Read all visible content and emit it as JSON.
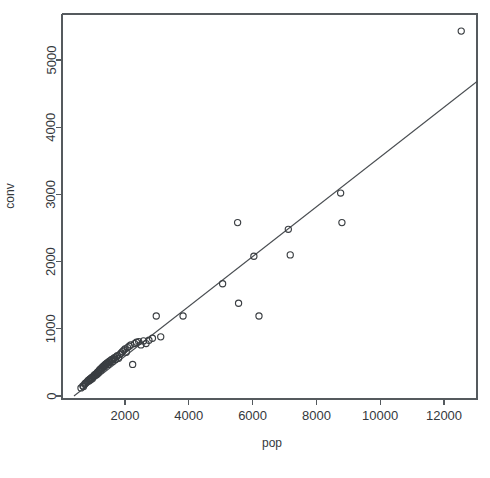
{
  "figure": {
    "background_color": "#ffffff",
    "foreground_color": "#3a3e42",
    "axis_color": "#555a5e"
  },
  "chart_data": {
    "type": "scatter",
    "title": "",
    "subtitle": "",
    "xlabel": "pop",
    "ylabel": "conv",
    "xlim": [
      380,
      13050
    ],
    "ylim": [
      -130,
      5730
    ],
    "grid": false,
    "legend": null,
    "x_ticks": [
      2000,
      4000,
      6000,
      8000,
      10000,
      12000
    ],
    "x_tick_labels": [
      "2000",
      "4000",
      "6000",
      "8000",
      "10000",
      "12000"
    ],
    "y_ticks": [
      0,
      1000,
      2000,
      3000,
      4000,
      5000
    ],
    "y_tick_labels": [
      "0",
      "1000",
      "2000",
      "3000",
      "4000",
      "5000"
    ],
    "point_marker": "open-circle",
    "point_radius_px": 3.1,
    "series": [
      {
        "name": "conv vs pop",
        "x": [
          620,
          680,
          700,
          735,
          760,
          790,
          820,
          845,
          870,
          890,
          905,
          925,
          945,
          960,
          980,
          1000,
          1020,
          1035,
          1050,
          1070,
          1090,
          1110,
          1125,
          1140,
          1160,
          1175,
          1190,
          1210,
          1230,
          1250,
          1265,
          1280,
          1300,
          1320,
          1340,
          1355,
          1370,
          1390,
          1410,
          1430,
          1450,
          1470,
          1490,
          1510,
          1535,
          1560,
          1585,
          1610,
          1640,
          1670,
          1700,
          1730,
          1760,
          1800,
          1840,
          1880,
          1920,
          1960,
          2000,
          2040,
          2080,
          2130,
          2180,
          2240,
          2300,
          2360,
          2430,
          2500,
          2580,
          2660,
          2750,
          2860,
          2980,
          3120,
          3820,
          5060,
          5530,
          5560,
          6040,
          6200,
          7120,
          7180,
          8760,
          8800,
          12540
        ],
        "y": [
          120,
          150,
          140,
          175,
          190,
          200,
          215,
          230,
          225,
          245,
          255,
          240,
          265,
          275,
          260,
          285,
          295,
          310,
          300,
          320,
          330,
          315,
          345,
          355,
          340,
          365,
          375,
          390,
          400,
          385,
          410,
          425,
          415,
          440,
          450,
          435,
          460,
          475,
          465,
          485,
          495,
          470,
          505,
          520,
          500,
          530,
          545,
          515,
          555,
          570,
          545,
          585,
          600,
          560,
          620,
          640,
          660,
          680,
          700,
          650,
          720,
          740,
          760,
          470,
          780,
          800,
          810,
          760,
          820,
          780,
          830,
          860,
          1190,
          880,
          1190,
          1670,
          2580,
          1380,
          2080,
          1190,
          2480,
          2100,
          3020,
          2580,
          5430
        ]
      }
    ],
    "fit_line": {
      "name": "linear fit",
      "x_start": 400,
      "y_start": 0,
      "x_end": 13050,
      "y_end": 4680,
      "slope": 0.37,
      "intercept": -148
    }
  },
  "labels": {
    "y_axis_title": "conv",
    "x_axis_title": "pop"
  }
}
